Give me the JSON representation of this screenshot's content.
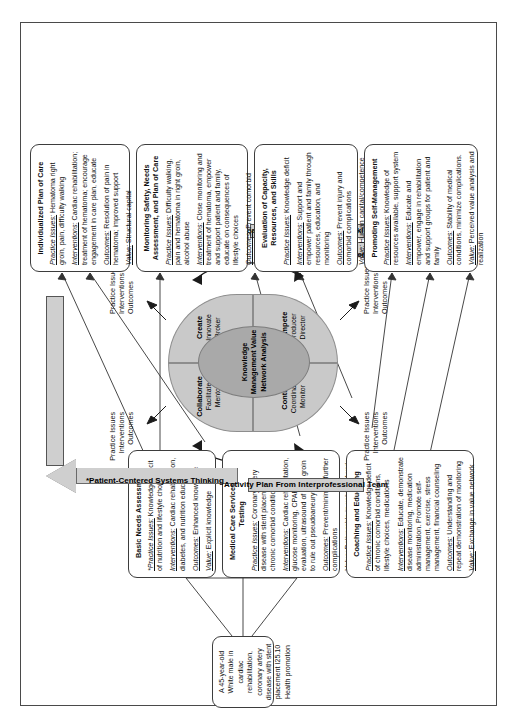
{
  "patient": {
    "text": "A 45-year-old White male in cardiac rehabilitation, coronary artery disease with stent placement I25.10 Health promotion"
  },
  "banners": {
    "activity_plan": "Activity Plan From Interprofessional Team",
    "team_centered": "Team-Centered Systems Thinking"
  },
  "arrows": {
    "patient_centered": "*Patient-Centered Systems Thinking",
    "organization_centered": "Organization-Centered Systems Thinking"
  },
  "flow_triplet": {
    "line1": "Practice Issues",
    "line2": "Interventions",
    "line3": "Outcomes"
  },
  "wheel": {
    "core": "Knowledge Management Value Network Analysis",
    "quadrants": [
      {
        "name": "Collaborate",
        "role1": "Facilitate",
        "role2": "Mentor"
      },
      {
        "name": "Create",
        "role1": "Innovate",
        "role2": "Broker"
      },
      {
        "name": "Control",
        "role1": "Coordinate",
        "role2": "Monitor"
      },
      {
        "name": "Compete",
        "role1": "Producer",
        "role2": "Director"
      }
    ]
  },
  "boxes": {
    "basic_needs": {
      "title": "Basic Needs Assessment",
      "practice_label": "*Practice Issues:",
      "practice_text": " Knowledge deficit of nutrition and lifestyle choices",
      "interventions_label": "Interventions:",
      "interventions_text": " Cardiac rehabilitation, diabetes, and nutrition education",
      "outcomes_label": "Outcomes:",
      "outcomes_text": " Enhanced knowledge",
      "value_label": "Value:",
      "value_text": " Explicit knowledge"
    },
    "medical_care": {
      "title": "Medical Care Services and Testing",
      "practice_label": "Practice Issues:",
      "practice_text": " Coronary artery disease with stent placement, chronic comorbid conditions",
      "interventions_label": "Interventions:",
      "interventions_text": " Cardiac rehabilitation, glucose monitoring, CPAP evaluation, ultrasound of right groin to rule out pseudoaneurysm",
      "outcomes_label": "Outcomes:",
      "outcomes_text": " Prevent/minimize further complications",
      "value_label": "Value:",
      "value_text": " Deliverable in value network"
    },
    "coaching": {
      "title": "Coaching and Educating",
      "practice_label": "Practice Issues:",
      "practice_text": " Knowledge deficit of chronic comorbid conditions, lifestyle choices, medications",
      "interventions_label": "Interventions:",
      "interventions_text": " Educate, demonstrate disease monitoring, medication administration. Promote self-management, exercise, stress management, financial counseling",
      "outcomes_label": "Outcomes:",
      "outcomes_text": " Understanding and repeat demonstration of monitoring",
      "value_label": "Value:",
      "value_text": " Exchange in value network"
    },
    "individualized_plan": {
      "title": "Individualized Plan of Care",
      "practice_label": "Practice Issues:",
      "practice_text": " Hematoma right groin, pain, difficulty walking",
      "interventions_label": "Interventions:",
      "interventions_text": " Cardiac rehabilitation; treatment of hematoma; encourage engagement in care plan, educate",
      "outcomes_label": "Outcomes:",
      "outcomes_text": " Resolution of pain in hematoma; improved support",
      "value_label": "Value:",
      "value_text": " Structural capital"
    },
    "monitoring_safety": {
      "title": "Monitoring Safety, Needs Assessment, and Plan of Care",
      "practice_label": "Practice Issues:",
      "practice_text": " Difficulty walking, pain and hematoma in right groin, alcohol abuse",
      "interventions_label": "Interventions:",
      "interventions_text": " Close monitoring and treatment of hematoma, empower and support patient and family, educate on consequences of lifestyle choices",
      "outcomes_label": "Outcomes:",
      "outcomes_text": " Prevent comorbid complications",
      "value_label": "Value:",
      "value_text": " Feedback/resilience in a network"
    },
    "evaluation_capacity": {
      "title": "Evaluation of Capacity, Resources, and Skills",
      "practice_label": "Practice Issues:",
      "practice_text": " Knowledge deficit",
      "interventions_label": "Interventions:",
      "interventions_text": " Support and empower patient and family through resources, education, and monitoring",
      "outcomes_label": "Outcomes:",
      "outcomes_text": " Prevent injury and comorbid complications",
      "value_label": "Value:",
      "value_text": " Human capital/competence"
    },
    "promoting_self": {
      "title": "Promoting Self-Management",
      "practice_label": "Practice Issues:",
      "practice_text": " Knowledge of resources available, support system",
      "interventions_label": "Interventions:",
      "interventions_text": " Educate and empower, engage in rehabilitation and support groups for patient and family",
      "outcomes_label": "Outcomes:",
      "outcomes_text": " Stability of medical conditions, minimize complications.",
      "value_label": "Value:",
      "value_text": " Perceived value analysis and realization"
    }
  }
}
